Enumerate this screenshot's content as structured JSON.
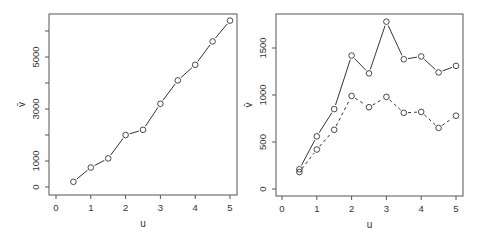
{
  "chart_data": [
    {
      "type": "line",
      "title": "",
      "xlabel": "u",
      "ylabel": "v̄",
      "x": [
        0.5,
        1.0,
        1.5,
        2.0,
        2.5,
        3.0,
        3.5,
        4.0,
        4.5,
        5.0
      ],
      "series": [
        {
          "name": "v̄",
          "style": "solid",
          "marker": "open-circle",
          "values": [
            200,
            750,
            1100,
            2000,
            2200,
            3200,
            4100,
            4700,
            5600,
            6400
          ]
        }
      ],
      "xticks": [
        0,
        1,
        2,
        3,
        4,
        5
      ],
      "yticks": [
        0,
        1000,
        2000,
        3000,
        4000,
        5000,
        6000
      ],
      "ytick_labels": [
        "0",
        "1000",
        "",
        "3000",
        "",
        "5000",
        ""
      ],
      "xlim": [
        -0.2,
        5.2
      ],
      "ylim": [
        -300,
        6800
      ],
      "grid": false,
      "legend": null
    },
    {
      "type": "line",
      "title": "",
      "xlabel": "u",
      "ylabel": "v̄",
      "x": [
        0.5,
        1.0,
        1.5,
        2.0,
        2.5,
        3.0,
        3.5,
        4.0,
        4.5,
        5.0
      ],
      "series": [
        {
          "name": "series-solid",
          "style": "solid",
          "marker": "open-circle",
          "values": [
            210,
            560,
            850,
            1420,
            1230,
            1780,
            1380,
            1410,
            1240,
            1310
          ]
        },
        {
          "name": "series-dashed",
          "style": "dashed",
          "marker": "open-circle",
          "values": [
            180,
            420,
            630,
            990,
            870,
            980,
            810,
            820,
            650,
            780
          ]
        }
      ],
      "xticks": [
        0,
        1,
        2,
        3,
        4,
        5
      ],
      "yticks": [
        0,
        500,
        1000,
        1500
      ],
      "ytick_labels": [
        "0",
        "500",
        "1000",
        "1500"
      ],
      "xlim": [
        -0.2,
        5.2
      ],
      "ylim": [
        -70,
        1850
      ],
      "grid": false,
      "legend": null
    }
  ],
  "layout": {
    "panels": [
      {
        "box": {
          "x0": 49,
          "y0": 14,
          "x1": 237,
          "y1": 195
        },
        "xmap": {
          "origin": 56,
          "scale": 34.8
        },
        "ymap": {
          "origin": 187,
          "scale": 0.026
        }
      },
      {
        "box": {
          "x0": 276,
          "y0": 14,
          "x1": 463,
          "y1": 196
        },
        "xmap": {
          "origin": 282,
          "scale": 34.8
        },
        "ymap": {
          "origin": 189,
          "scale": 0.094
        }
      }
    ]
  },
  "colors": {
    "axis": "#555555",
    "line": "#333333",
    "text": "#333333"
  }
}
